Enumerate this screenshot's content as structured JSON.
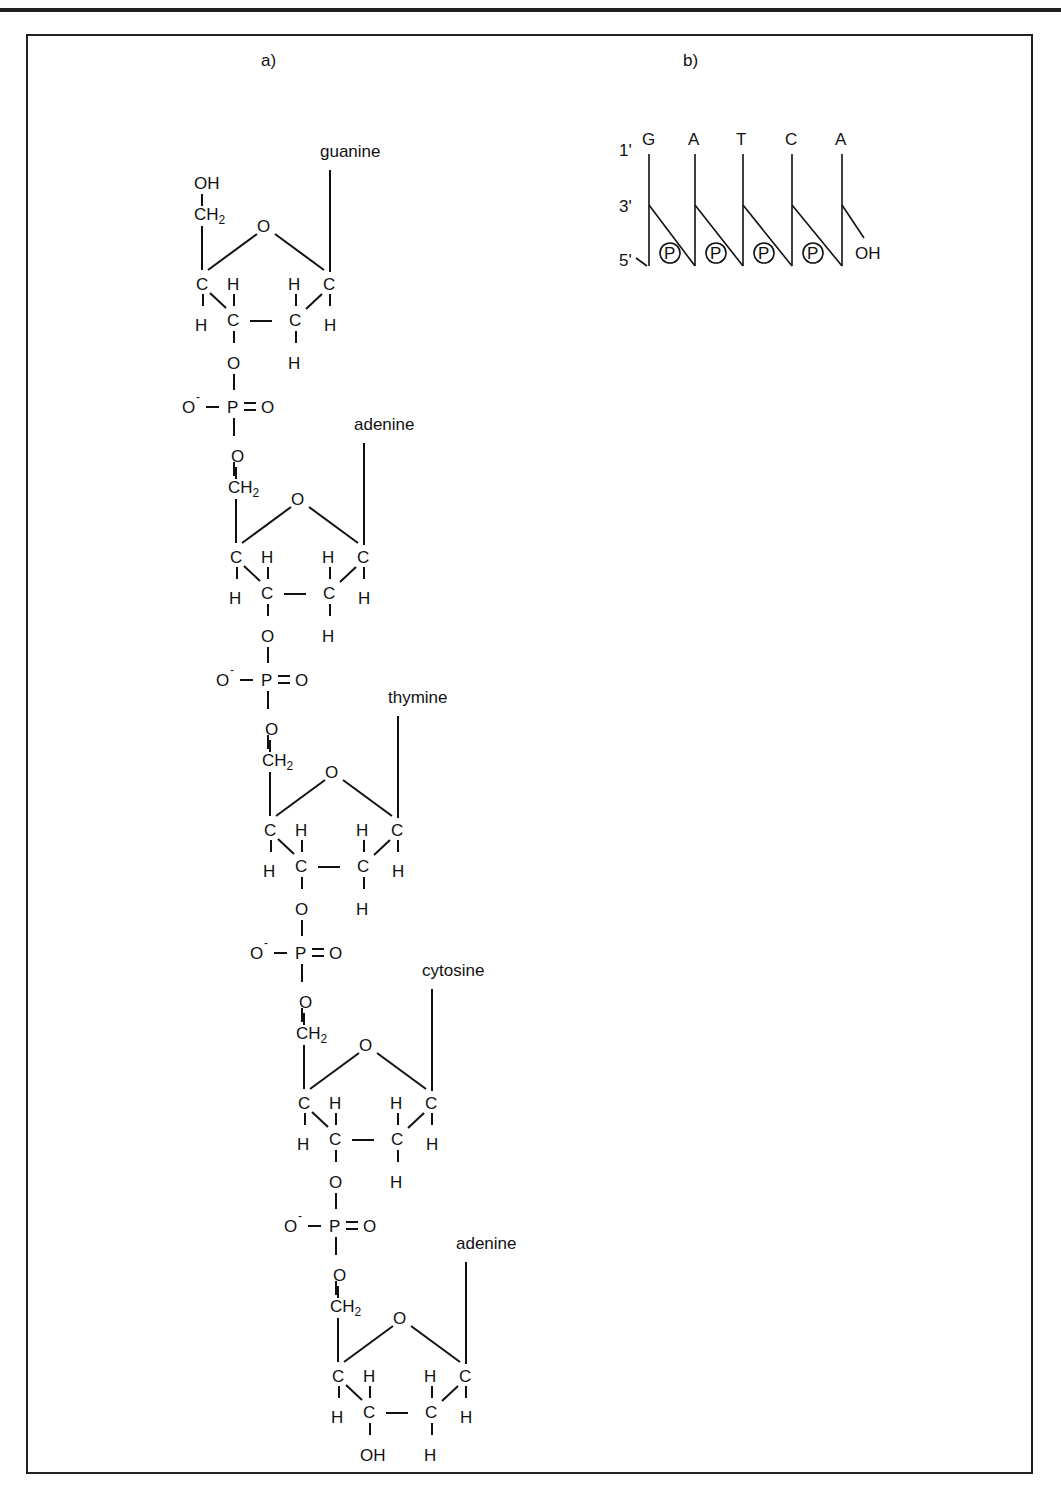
{
  "panels": {
    "a": {
      "label": "a)"
    },
    "b": {
      "label": "b)"
    }
  },
  "panel_a": {
    "title_label": "a)",
    "nucleotides": [
      {
        "base": "guanine",
        "five_prime_group": "OH",
        "three_prime_group": "O",
        "ox": 0,
        "oy": 0
      },
      {
        "base": "adenine",
        "five_prime_group": "O",
        "three_prime_group": "O",
        "ox": 34,
        "oy": 273
      },
      {
        "base": "thymine",
        "five_prime_group": "O",
        "three_prime_group": "O",
        "ox": 68,
        "oy": 546
      },
      {
        "base": "cytosine",
        "five_prime_group": "O",
        "three_prime_group": "O",
        "ox": 102,
        "oy": 819
      },
      {
        "base": "adenine",
        "five_prime_group": "O",
        "three_prime_group": "OH",
        "ox": 136,
        "oy": 1092
      }
    ],
    "phosphate": {
      "charged_oxygen": "O",
      "charge": "-",
      "phosphorus": "P",
      "double_bond_oxygen": "O"
    },
    "atoms": {
      "carbon": "C",
      "hydrogen": "H",
      "oxygen": "O",
      "ch2": "CH",
      "ch2_sub": "2",
      "hydroxyl": "OH"
    }
  },
  "panel_b": {
    "title_label": "b)",
    "sequence": [
      "G",
      "A",
      "T",
      "C",
      "A"
    ],
    "position_labels": {
      "one_prime": "1'",
      "three_prime": "3'",
      "five_prime": "5'"
    },
    "phosphate_symbol": "P",
    "terminal_group": "OH"
  }
}
